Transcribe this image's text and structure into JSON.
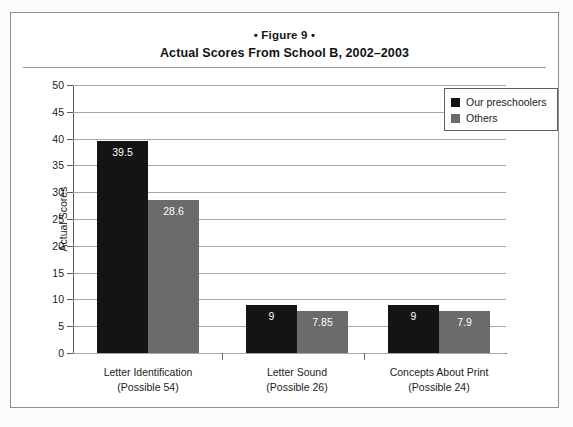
{
  "figure": {
    "label": "• Figure 9 •",
    "title": "Actual Scores From School B, 2002–2003"
  },
  "chart_data": {
    "type": "bar",
    "title": "Actual Scores From School B, 2002–2003",
    "subtitle": "• Figure 9 •",
    "xlabel": "",
    "ylabel": "Actual Scores",
    "ylim": [
      0,
      50
    ],
    "ytick_step": 5,
    "yticks": [
      50,
      45,
      40,
      35,
      30,
      25,
      20,
      15,
      10,
      5,
      0
    ],
    "grid": true,
    "legend_position": "top-right",
    "categories": [
      {
        "line1": "Letter Identification",
        "line2": "(Possible 54)"
      },
      {
        "line1": "Letter Sound",
        "line2": "(Possible 26)"
      },
      {
        "line1": "Concepts About Print",
        "line2": "(Possible 24)"
      }
    ],
    "series": [
      {
        "name": "Our preschoolers",
        "color": "#141414",
        "values": [
          39.5,
          9,
          9
        ],
        "labels": [
          "39.5",
          "9",
          "9"
        ]
      },
      {
        "name": "Others",
        "color": "#6b6b6b",
        "values": [
          28.6,
          7.85,
          7.9
        ],
        "labels": [
          "28.6",
          "7.85",
          "7.9"
        ]
      }
    ]
  }
}
